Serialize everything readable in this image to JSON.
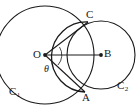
{
  "figure": {
    "type": "geometry-diagram",
    "background_color": "#ffffff",
    "stroke_color": "#1a1a1a",
    "canvas": {
      "width": 140,
      "height": 112
    },
    "labels": {
      "center_left": "O",
      "center_right": "B",
      "intersection_top": "C",
      "intersection_bottom": "A",
      "angle": "θ",
      "circle_left_main": "C",
      "circle_left_sub": "1",
      "circle_right_main": "C",
      "circle_right_sub": "2"
    },
    "circles": [
      {
        "name": "C1",
        "cx": 45,
        "cy": 55,
        "r": 49
      },
      {
        "name": "C2",
        "cx": 101,
        "cy": 55,
        "r": 34
      }
    ],
    "points": [
      {
        "name": "O",
        "x": 45,
        "y": 55,
        "dot": true
      },
      {
        "name": "B",
        "x": 101,
        "y": 55,
        "dot": true
      },
      {
        "name": "C",
        "x": 88,
        "y": 22,
        "dot": false
      },
      {
        "name": "A",
        "x": 85,
        "y": 92,
        "dot": false
      }
    ],
    "segments": [
      {
        "name": "OC",
        "from": "O",
        "to": "C"
      },
      {
        "name": "OA",
        "from": "O",
        "to": "A"
      },
      {
        "name": "OB",
        "from": "O",
        "to": "B"
      }
    ],
    "angle_mark": {
      "name": "theta-arc",
      "at": "O",
      "value": "θ"
    }
  }
}
